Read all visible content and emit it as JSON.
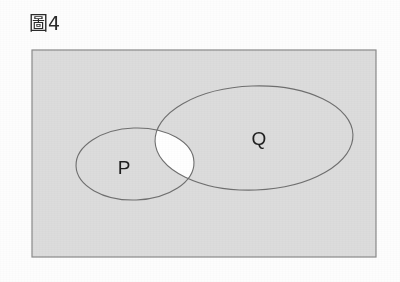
{
  "figure": {
    "caption": "圖4",
    "caption_number": "4",
    "caption_prefix": "圖"
  },
  "diagram": {
    "type": "venn",
    "universe": {
      "name": "universal-set-rectangle",
      "x": 32,
      "y": 50,
      "width": 344,
      "height": 207,
      "fill": "#dcdcdc",
      "stroke": "#8a8a8a",
      "stroke_width": 1.2
    },
    "sets": [
      {
        "id": "P",
        "label": "P",
        "shape": "ellipse",
        "cx": 135,
        "cy": 164,
        "rx": 59,
        "ry": 36,
        "rotation": -2,
        "stroke": "#6f6f6f",
        "stroke_width": 1.1,
        "fill": "none",
        "label_x": 124,
        "label_y": 174
      },
      {
        "id": "Q",
        "label": "Q",
        "shape": "ellipse",
        "cx": 254,
        "cy": 138,
        "rx": 99,
        "ry": 52,
        "rotation": -2,
        "stroke": "#6f6f6f",
        "stroke_width": 1.1,
        "fill": "none",
        "label_x": 259,
        "label_y": 145
      }
    ],
    "intersection": {
      "id": "P-and-Q",
      "label": "P∩Q",
      "fill": "#ffffff",
      "shaded": false,
      "note": "lens-shaped overlap region rendered white (unshaded)"
    },
    "colors": {
      "background": "#fdfdfd",
      "universe_fill": "#dcdcdc",
      "intersection_fill": "#ffffff",
      "outline": "#6f6f6f",
      "rect_outline": "#8a8a8a",
      "text": "#1f1f1f"
    }
  }
}
